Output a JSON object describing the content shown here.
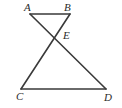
{
  "figure": {
    "kind": "geometry-diagram",
    "background_color": "#ffffff",
    "stroke_color": "#3a3a3a",
    "label_color": "#2b2b2b",
    "stroke_width": 1.6,
    "points": {
      "A": {
        "label": "A",
        "x": 30,
        "y": 14
      },
      "B": {
        "label": "B",
        "x": 70,
        "y": 14
      },
      "C": {
        "label": "C",
        "x": 21,
        "y": 89
      },
      "D": {
        "label": "D",
        "x": 106,
        "y": 89
      },
      "E": {
        "label": "E",
        "x": 55,
        "y": 36
      }
    },
    "segments": [
      {
        "name": "AB",
        "from": "A",
        "to": "B"
      },
      {
        "name": "CD",
        "from": "C",
        "to": "D"
      },
      {
        "name": "AD",
        "from": "A",
        "to": "D"
      },
      {
        "name": "BC",
        "from": "B",
        "to": "C"
      }
    ]
  }
}
